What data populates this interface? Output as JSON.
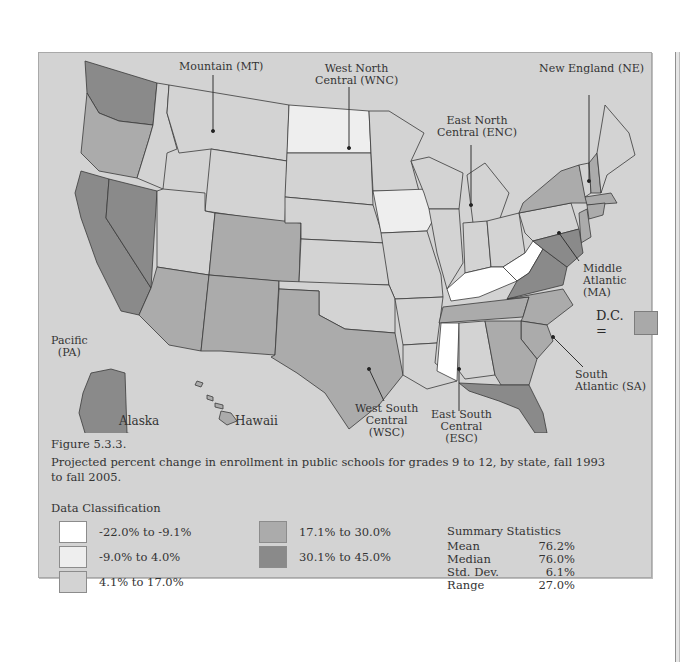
{
  "figure": {
    "number": "Figure 5.3.3.",
    "caption": "Projected percent change in enrollment in public schools for grades 9 to 12, by state, fall 1993 to fall 2005."
  },
  "region_labels": {
    "mountain": "Mountain (MT)",
    "wnc_1": "West North",
    "wnc_2": "Central (WNC)",
    "enc_1": "East North",
    "enc_2": "Central (ENC)",
    "ne": "New England (NE)",
    "ma_1": "Middle",
    "ma_2": "Atlantic",
    "ma_3": "(MA)",
    "pa_1": "Pacific",
    "pa_2": "(PA)",
    "sa_1": "South",
    "sa_2": "Atlantic (SA)",
    "wsc_1": "West South",
    "wsc_2": "Central",
    "wsc_3": "(WSC)",
    "esc_1": "East South",
    "esc_2": "Central",
    "esc_3": "(ESC)",
    "alaska": "Alaska",
    "hawaii": "Hawaii",
    "dc": "D.C. ="
  },
  "legend": {
    "title": "Data Classification",
    "classes": [
      {
        "label": "-22.0% to -9.1%",
        "color": "#ffffff"
      },
      {
        "label": "-9.0% to 4.0%",
        "color": "#eeeeee"
      },
      {
        "label": "4.1% to 17.0%",
        "color": "#d3d3d3"
      },
      {
        "label": "17.1% to 30.0%",
        "color": "#ababab"
      },
      {
        "label": "30.1% to 45.0%",
        "color": "#8a8a8a"
      }
    ]
  },
  "summary": {
    "title": "Summary Statistics",
    "rows": [
      {
        "label": "Mean",
        "value": "76.2%"
      },
      {
        "label": "Median",
        "value": "76.0%"
      },
      {
        "label": "Std. Dev.",
        "value": "6.1%"
      },
      {
        "label": "Range",
        "value": "27.0%"
      }
    ]
  },
  "map_data": {
    "type": "choropleth",
    "title": "Projected percent change in enrollment in public schools for grades 9 to 12, by state, fall 1993 to fall 2005",
    "classes_by_state": {
      "WA": "30.1% to 45.0%",
      "OR": "17.1% to 30.0%",
      "CA": "30.1% to 45.0%",
      "NV": "30.1% to 45.0%",
      "ID": "4.1% to 17.0%",
      "MT": "4.1% to 17.0%",
      "WY": "4.1% to 17.0%",
      "UT": "4.1% to 17.0%",
      "CO": "17.1% to 30.0%",
      "AZ": "17.1% to 30.0%",
      "NM": "17.1% to 30.0%",
      "ND": "-9.0% to 4.0%",
      "SD": "4.1% to 17.0%",
      "NE": "4.1% to 17.0%",
      "KS": "4.1% to 17.0%",
      "MN": "4.1% to 17.0%",
      "IA": "-9.0% to 4.0%",
      "MO": "4.1% to 17.0%",
      "TX": "17.1% to 30.0%",
      "OK": "4.1% to 17.0%",
      "AR": "4.1% to 17.0%",
      "LA": "4.1% to 17.0%",
      "WI": "4.1% to 17.0%",
      "MI": "4.1% to 17.0%",
      "IL": "4.1% to 17.0%",
      "IN": "4.1% to 17.0%",
      "OH": "4.1% to 17.0%",
      "KY": "-22.0% to -9.1%",
      "TN": "17.1% to 30.0%",
      "MS": "-22.0% to -9.1%",
      "AL": "4.1% to 17.0%",
      "WV": "-22.0% to -9.1%",
      "VA": "30.1% to 45.0%",
      "NC": "17.1% to 30.0%",
      "SC": "17.1% to 30.0%",
      "GA": "17.1% to 30.0%",
      "FL": "30.1% to 45.0%",
      "MD": "30.1% to 45.0%",
      "DE": "17.1% to 30.0%",
      "PA": "4.1% to 17.0%",
      "NY": "17.1% to 30.0%",
      "NJ": "17.1% to 30.0%",
      "VT": "4.1% to 17.0%",
      "NH": "17.1% to 30.0%",
      "ME": "4.1% to 17.0%",
      "MA": "17.1% to 30.0%",
      "CT": "17.1% to 30.0%",
      "RI": "17.1% to 30.0%",
      "AK": "30.1% to 45.0%",
      "HI": "17.1% to 30.0%",
      "DC": "17.1% to 30.0%"
    }
  }
}
